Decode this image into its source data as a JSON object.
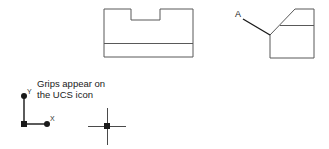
{
  "figure": {
    "caption": {
      "line1": "Grips appear on",
      "line2": "the UCS icon"
    },
    "callout_label": "A",
    "ucs_icon": {
      "x_axis_label": "X",
      "y_axis_label": "Y"
    },
    "colors": {
      "drawing_line": "#595959",
      "leader_line": "#1a1a1a",
      "grip": "#1a1a1a",
      "crosshair": "#4a4a4a",
      "text": "#1a1a1a",
      "background": "#ffffff"
    },
    "shapes": {
      "notched_block": {
        "name": "notched-block-outline",
        "outline_points": "104,9 104,57 193,57 193,9 160,9 160,20 131,20 131,9 104,9",
        "interior_line": {
          "x1": 104,
          "y1": 43,
          "x2": 193,
          "y2": 43
        }
      },
      "chamfered_block": {
        "name": "chamfered-block-outline",
        "outline_points": "270,35 295,9 314,9 314,58 270,58 270,35",
        "interior_line": {
          "x1": 280,
          "y1": 25,
          "x2": 314,
          "y2": 25
        }
      },
      "leader": {
        "x1": 243,
        "y1": 19,
        "x2": 270,
        "y2": 35
      }
    }
  }
}
